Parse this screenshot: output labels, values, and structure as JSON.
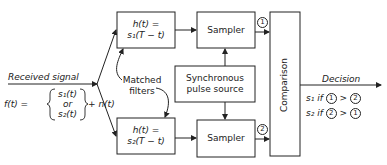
{
  "input": {
    "label": "Received signal",
    "f_lhs": "f(t) =",
    "signal_options": [
      "s₁(t)",
      "or",
      "s₂(t)"
    ],
    "noise_term": "+ n(t)"
  },
  "filters": {
    "top": {
      "line1": "h(t) =",
      "line2": "s₁(T − t)"
    },
    "bottom": {
      "line1": "h(t) =",
      "line2": "s₂(T − t)"
    },
    "annotation_line1": "Matched",
    "annotation_line2": "filters"
  },
  "samplers": {
    "top": "Sampler",
    "bottom": "Sampler",
    "top_output_marker": "1",
    "bottom_output_marker": "2"
  },
  "pulse_source": {
    "line1": "Synchronous",
    "line2": "pulse source"
  },
  "comparison": {
    "label": "Comparison"
  },
  "decision": {
    "label": "Decision",
    "rule1": {
      "symbol": "s₁",
      "word": "if",
      "a": "1",
      "op": ">",
      "b": "2"
    },
    "rule2": {
      "symbol": "s₂",
      "word": "if",
      "a": "2",
      "op": ">",
      "b": "1"
    }
  },
  "colors": {
    "ink": "#222222",
    "background": "#ffffff"
  }
}
